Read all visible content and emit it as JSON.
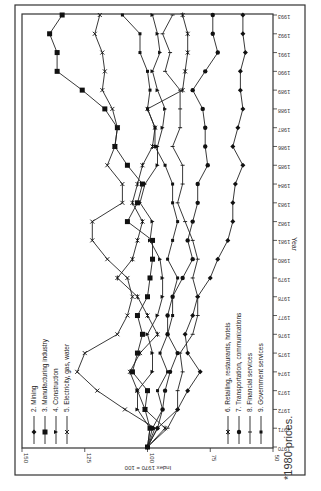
{
  "chart_data": {
    "type": "line",
    "orientation": "rotated-90-clockwise",
    "title": "",
    "xlabel": "Year",
    "ylabel": "Index 1970 = 100",
    "ylim": [
      50,
      150
    ],
    "yticks": [
      50,
      75,
      100,
      125,
      150
    ],
    "x": [
      1970,
      1971,
      1972,
      1973,
      1974,
      1975,
      1976,
      1977,
      1978,
      1979,
      1980,
      1981,
      1982,
      1983,
      1984,
      1985,
      1986,
      1987,
      1988,
      1989,
      1990,
      1991,
      1992,
      1993
    ],
    "legend_position": "inside, split in two groups",
    "series": [
      {
        "name": "2. Mining",
        "marker": "diamond",
        "values": [
          100,
          96,
          88,
          84,
          79,
          84,
          85,
          82,
          80,
          75,
          72,
          68,
          66,
          66,
          65,
          62,
          66,
          64,
          62,
          63,
          63,
          61,
          62,
          62
        ]
      },
      {
        "name": "3. Manufacturing industry",
        "marker": "square",
        "values": [
          100,
          99,
          101,
          100,
          106,
          104,
          102,
          104,
          100,
          99,
          98,
          98,
          108,
          104,
          102,
          108,
          113,
          112,
          117,
          126,
          136,
          136,
          139,
          134
        ]
      },
      {
        "name": "4. Construction",
        "marker": "triangle",
        "values": [
          100,
          99,
          104,
          104,
          98,
          98,
          100,
          96,
          94,
          94,
          95,
          99,
          98,
          103,
          101,
          96,
          96,
          94,
          93,
          96,
          98,
          95,
          96,
          98
        ]
      },
      {
        "name": "5. Electricity, gas, water",
        "marker": "x",
        "values": [
          100,
          97,
          109,
          120,
          128,
          125,
          112,
          108,
          106,
          108,
          116,
          122,
          122,
          110,
          110,
          116,
          113,
          112,
          114,
          118,
          117,
          118,
          121,
          119
        ]
      },
      {
        "name": "6. Retailing, restaurants, hotels",
        "marker": "star",
        "values": [
          100,
          93,
          101,
          104,
          107,
          103,
          96,
          100,
          104,
          112,
          106,
          104,
          102,
          106,
          104,
          102,
          98,
          97,
          100,
          86,
          85,
          84,
          84,
          86
        ]
      },
      {
        "name": "7. Transportation, communications",
        "marker": "circle",
        "values": [
          100,
          98,
          94,
          93,
          91,
          88,
          92,
          92,
          90,
          86,
          82,
          84,
          82,
          80,
          80,
          76,
          77,
          77,
          78,
          82,
          77,
          72,
          74,
          74
        ]
      },
      {
        "name": "8. Financial services",
        "marker": "plus",
        "values": [
          100,
          92,
          88,
          88,
          86,
          87,
          82,
          80,
          80,
          82,
          80,
          82,
          85,
          88,
          86,
          86,
          90,
          87,
          87,
          87,
          93,
          91,
          94,
          90
        ]
      },
      {
        "name": "9. Government services",
        "marker": "square-small",
        "values": [
          100,
          96,
          94,
          96,
          92,
          95,
          92,
          90,
          90,
          88,
          92,
          90,
          88,
          90,
          90,
          93,
          97,
          97,
          100,
          99,
          100,
          103,
          103,
          110
        ]
      }
    ]
  },
  "legend_left": [
    "2. Mining",
    "3. Manufacturing industry",
    "4. Construction",
    "5. Electricity, gas, water"
  ],
  "legend_right": [
    "6. Retailing, restaurants, hotels",
    "7. Transportation, communications",
    "8. Financial services",
    "9. Government services"
  ],
  "axis": {
    "index_label": "Index 1970 = 100",
    "year_label": "Year",
    "index_ticks": [
      "150",
      "125",
      "100",
      "75",
      "50"
    ],
    "year_ticks": [
      "1970",
      "1971",
      "1972",
      "1973",
      "1974",
      "1975",
      "1976",
      "1977",
      "1978",
      "1979",
      "1980",
      "1981",
      "1982",
      "1983",
      "1984",
      "1985",
      "1986",
      "1987",
      "1988",
      "1989",
      "1990",
      "1991",
      "1992",
      "1993"
    ]
  },
  "footnote": "*1980 prices."
}
